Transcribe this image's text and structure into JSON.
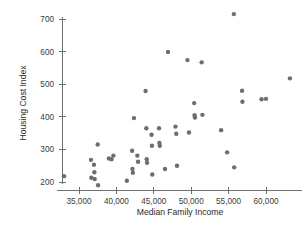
{
  "chart_data": {
    "type": "scatter",
    "title": "",
    "xlabel": "Median Family Income",
    "ylabel": "Housing Cost Index",
    "xlim": [
      32000,
      64500
    ],
    "ylim": [
      175,
      730
    ],
    "grid": false,
    "legend": null,
    "xticks": [
      35000,
      40000,
      45000,
      50000,
      55000,
      60000
    ],
    "xticklabels": [
      "35,000",
      "40,000",
      "45,000",
      "50,000",
      "55,000",
      "60,000"
    ],
    "yticks": [
      200,
      300,
      400,
      500,
      600,
      700
    ],
    "yticklabels": [
      "200",
      "300",
      "400",
      "500",
      "600",
      "700"
    ],
    "marker": {
      "shape": "circle",
      "color": "#6e6e6e",
      "size": 4.4
    },
    "points": [
      {
        "x": 33000,
        "y": 218
      },
      {
        "x": 36600,
        "y": 268
      },
      {
        "x": 36650,
        "y": 213
      },
      {
        "x": 37000,
        "y": 253
      },
      {
        "x": 37050,
        "y": 230
      },
      {
        "x": 37100,
        "y": 209
      },
      {
        "x": 37500,
        "y": 315
      },
      {
        "x": 37550,
        "y": 190
      },
      {
        "x": 39000,
        "y": 272
      },
      {
        "x": 39350,
        "y": 270
      },
      {
        "x": 39600,
        "y": 281
      },
      {
        "x": 41400,
        "y": 204
      },
      {
        "x": 42100,
        "y": 296
      },
      {
        "x": 42150,
        "y": 240
      },
      {
        "x": 42200,
        "y": 228
      },
      {
        "x": 42350,
        "y": 396
      },
      {
        "x": 42800,
        "y": 281
      },
      {
        "x": 42900,
        "y": 262
      },
      {
        "x": 43900,
        "y": 479
      },
      {
        "x": 44000,
        "y": 365
      },
      {
        "x": 44050,
        "y": 270
      },
      {
        "x": 44100,
        "y": 259
      },
      {
        "x": 44700,
        "y": 345
      },
      {
        "x": 44750,
        "y": 311
      },
      {
        "x": 44800,
        "y": 223
      },
      {
        "x": 45700,
        "y": 365
      },
      {
        "x": 45750,
        "y": 320
      },
      {
        "x": 45800,
        "y": 311
      },
      {
        "x": 46500,
        "y": 240
      },
      {
        "x": 46900,
        "y": 599
      },
      {
        "x": 47900,
        "y": 370
      },
      {
        "x": 48000,
        "y": 348
      },
      {
        "x": 48100,
        "y": 250
      },
      {
        "x": 49500,
        "y": 574
      },
      {
        "x": 49700,
        "y": 352
      },
      {
        "x": 50400,
        "y": 442
      },
      {
        "x": 50450,
        "y": 405
      },
      {
        "x": 50500,
        "y": 398
      },
      {
        "x": 51400,
        "y": 567
      },
      {
        "x": 51500,
        "y": 406
      },
      {
        "x": 54000,
        "y": 359
      },
      {
        "x": 54800,
        "y": 291
      },
      {
        "x": 55700,
        "y": 715
      },
      {
        "x": 55750,
        "y": 245
      },
      {
        "x": 56800,
        "y": 480
      },
      {
        "x": 56850,
        "y": 446
      },
      {
        "x": 59400,
        "y": 454
      },
      {
        "x": 60000,
        "y": 455
      },
      {
        "x": 63200,
        "y": 518
      }
    ]
  },
  "figure": {
    "background_color": "#ffffff",
    "axis_color": "#6f6f6f"
  }
}
